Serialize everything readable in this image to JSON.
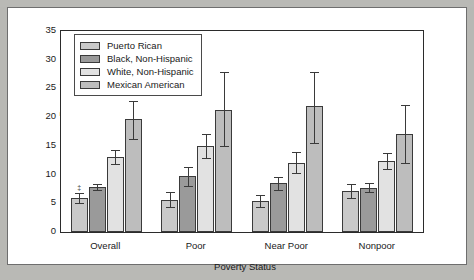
{
  "chart_data": {
    "type": "bar",
    "title": "",
    "xlabel": "Poverty Status",
    "ylabel": "Percentage",
    "categories": [
      "Overall",
      "Poor",
      "Near Poor",
      "Nonpoor"
    ],
    "ylim": [
      0,
      35
    ],
    "yticks": [
      0,
      5,
      10,
      15,
      20,
      25,
      30,
      35
    ],
    "grid": false,
    "legend_position": "upper left",
    "error_bars": "95% confidence interval",
    "annotations": [
      {
        "text": "‡",
        "category": "Overall",
        "series": "Puerto Rican",
        "note": "footnote marker above bar"
      }
    ],
    "series": [
      {
        "name": "Puerto Rican",
        "color": "#c9c9c9",
        "values": [
          5.9,
          5.6,
          5.4,
          7.2
        ],
        "err_low": [
          5.0,
          4.3,
          4.3,
          6.0
        ],
        "err_high": [
          6.8,
          6.9,
          6.5,
          8.4
        ]
      },
      {
        "name": "Black, Non-Hispanic",
        "color": "#9a9a9a",
        "values": [
          7.8,
          9.8,
          8.6,
          7.7
        ],
        "err_low": [
          7.3,
          8.0,
          7.3,
          6.9
        ],
        "err_high": [
          8.3,
          11.3,
          9.6,
          8.5
        ]
      },
      {
        "name": "White, Non-Hispanic",
        "color": "#e2e2e2",
        "values": [
          13.1,
          14.9,
          12.1,
          12.3
        ],
        "err_low": [
          11.9,
          12.8,
          10.2,
          10.9
        ],
        "err_high": [
          14.3,
          17.0,
          14.0,
          13.8
        ]
      },
      {
        "name": "Mexican American",
        "color": "#bdbdbd",
        "values": [
          19.6,
          21.3,
          21.9,
          17.1
        ],
        "err_low": [
          16.2,
          14.9,
          15.5,
          12.1
        ],
        "err_high": [
          22.8,
          27.8,
          27.8,
          22.1
        ]
      }
    ]
  }
}
